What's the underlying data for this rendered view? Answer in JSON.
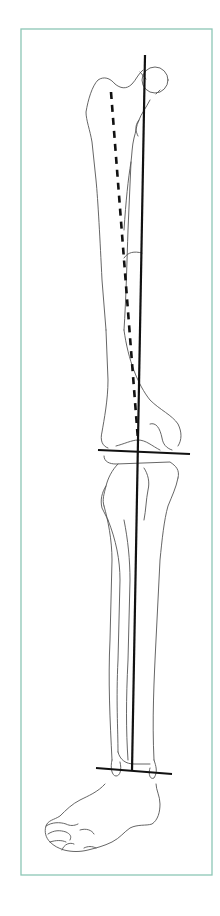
{
  "figure": {
    "frame_color": "#8cc6b5",
    "line_color": "#111111",
    "bone_outline_color": "#555555",
    "elements": {
      "mechanical_axis": "solid line from femoral head center to ankle center",
      "anatomical_femoral_axis": "dashed line along femoral shaft",
      "knee_joint_line": "horizontal line at knee",
      "ankle_joint_line": "horizontal line at ankle"
    }
  }
}
